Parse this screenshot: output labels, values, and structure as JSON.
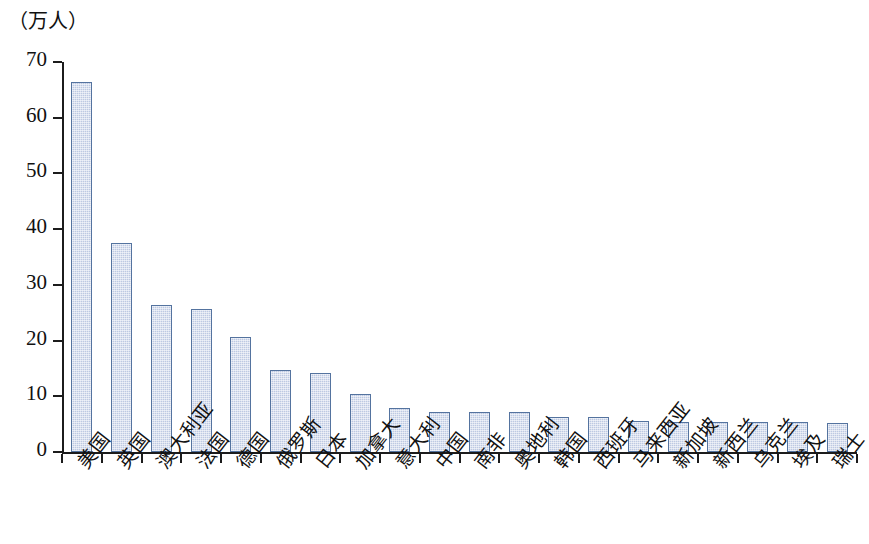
{
  "chart_data": {
    "type": "bar",
    "title": "",
    "subtitle": "",
    "xlabel": "",
    "ylabel": "（万人）",
    "unit_caption": "（万人）",
    "ylim": [
      0,
      70
    ],
    "ytick_labels": [
      "0",
      "10",
      "20",
      "30",
      "40",
      "50",
      "60",
      "70"
    ],
    "ytick_values": [
      0,
      10,
      20,
      30,
      40,
      50,
      60,
      70
    ],
    "grid": false,
    "legend": false,
    "legend_position": "none",
    "bar_fill_color": "#bdc9e2",
    "bar_border_color": "#54739f",
    "axis_color": "#1c1c1c",
    "categories": [
      "美国",
      "英国",
      "澳大利亚",
      "法国",
      "德国",
      "俄罗斯",
      "日本",
      "加拿大",
      "意大利",
      "中国",
      "南非",
      "奥地利",
      "韩国",
      "西班牙",
      "马来西亚",
      "新加坡",
      "新西兰",
      "乌克兰",
      "埃及",
      "瑞士"
    ],
    "values": [
      66.5,
      37.6,
      26.3,
      25.6,
      20.7,
      14.7,
      14.1,
      10.4,
      7.9,
      7.2,
      7.2,
      7.2,
      6.3,
      6.3,
      5.6,
      5.4,
      5.3,
      5.3,
      5.3,
      5.2
    ]
  }
}
